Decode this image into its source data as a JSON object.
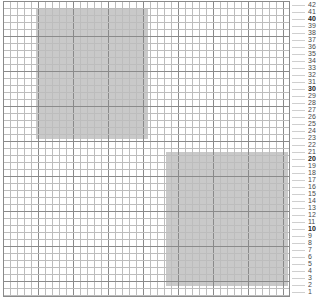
{
  "grid": {
    "cell_size_px": 7,
    "rows": 42,
    "columns": 41,
    "major_every": 5,
    "origin_x_px": 3,
    "origin_y_px": 1,
    "width_px": 287,
    "height_px": 296,
    "minor_line_color": "#bdbdbd",
    "major_line_color": "#8a8a8a",
    "background_color": "#ffffff",
    "fill_color": "#c9c9c9"
  },
  "row_numbers": {
    "top_value": 42,
    "bottom_value": 1,
    "bold_values": [
      40,
      30,
      20,
      10
    ],
    "labels": [
      "42",
      "41",
      "40",
      "39",
      "38",
      "37",
      "36",
      "35",
      "34",
      "33",
      "32",
      "31",
      "30",
      "29",
      "28",
      "27",
      "26",
      "25",
      "24",
      "23",
      "22",
      "21",
      "20",
      "19",
      "18",
      "17",
      "16",
      "15",
      "14",
      "13",
      "12",
      "11",
      "10",
      "9",
      "8",
      "7",
      "6",
      "5",
      "4",
      "3",
      "2",
      "1"
    ]
  },
  "blocks": [
    {
      "name": "upper-left-block",
      "left_px": 33,
      "top_px": 8,
      "width_px": 112,
      "height_px": 130,
      "color": "#c9c9c9"
    },
    {
      "name": "lower-right-block",
      "left_px": 163,
      "top_px": 151,
      "width_px": 122,
      "height_px": 134,
      "color": "#c9c9c9"
    }
  ],
  "chart_data": {
    "type": "heatmap",
    "title": "",
    "xlabel": "",
    "ylabel": "",
    "grid": true,
    "legend_position": "none",
    "x": [
      1,
      2,
      3,
      4,
      5,
      6,
      7,
      8,
      9,
      10,
      11,
      12,
      13,
      14,
      15,
      16,
      17,
      18,
      19,
      20,
      21,
      22,
      23,
      24,
      25,
      26,
      27,
      28,
      29,
      30,
      31,
      32,
      33,
      34,
      35,
      36,
      37,
      38,
      39,
      40,
      41
    ],
    "y_tick_labels": [
      "42",
      "41",
      "40",
      "39",
      "38",
      "37",
      "36",
      "35",
      "34",
      "33",
      "32",
      "31",
      "30",
      "29",
      "28",
      "27",
      "26",
      "25",
      "24",
      "23",
      "22",
      "21",
      "20",
      "19",
      "18",
      "17",
      "16",
      "15",
      "14",
      "13",
      "12",
      "11",
      "10",
      "9",
      "8",
      "7",
      "6",
      "5",
      "4",
      "3",
      "2",
      "1"
    ],
    "ylim": [
      1,
      42
    ],
    "values_legend": {
      "0": "#ffffff",
      "1": "#c9c9c9"
    },
    "filled_regions": [
      {
        "label": "upper-left",
        "col_start": 5,
        "col_end": 20,
        "row_top": 41,
        "row_bottom": 23,
        "value": 1
      },
      {
        "label": "lower-right",
        "col_start": 24,
        "col_end": 41,
        "row_top": 21,
        "row_bottom": 3,
        "value": 1
      }
    ]
  }
}
